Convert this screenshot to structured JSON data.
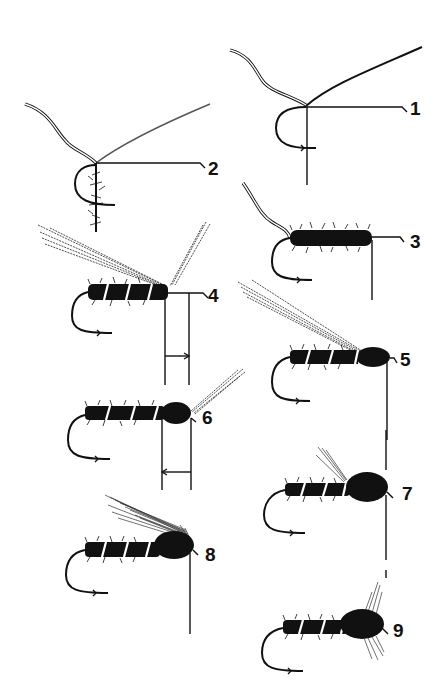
{
  "diagram": {
    "background": "#ffffff",
    "ink": "#111111",
    "steps": [
      {
        "number": "1",
        "label_x": 410,
        "label_y": 115,
        "description": "thread and rib wire tied in at hook shank"
      },
      {
        "number": "2",
        "label_x": 208,
        "label_y": 175,
        "description": "dubbing added to thread"
      },
      {
        "number": "3",
        "label_x": 410,
        "label_y": 248,
        "description": "dubbed body wound along shank"
      },
      {
        "number": "4",
        "label_x": 208,
        "label_y": 302,
        "description": "rib wound, wing case fibres and tails tied in"
      },
      {
        "number": "5",
        "label_x": 400,
        "label_y": 366,
        "description": "thorax dubbing added"
      },
      {
        "number": "6",
        "label_x": 202,
        "label_y": 424,
        "description": "thorax formed, legs fibres tied in"
      },
      {
        "number": "7",
        "label_x": 402,
        "label_y": 500,
        "description": "wing case pulled over thorax"
      },
      {
        "number": "8",
        "label_x": 205,
        "label_y": 561,
        "description": "hackle feather tied in"
      },
      {
        "number": "9",
        "label_x": 393,
        "label_y": 637,
        "description": "finished fly with hackle"
      }
    ]
  }
}
